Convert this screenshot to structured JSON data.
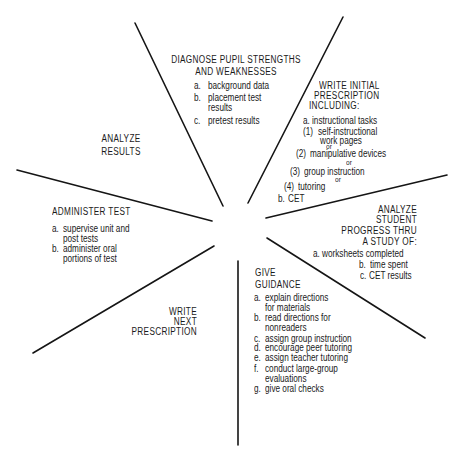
{
  "diagram": {
    "type": "cycle-wheel",
    "sectors": {
      "diagnose": {
        "title": [
          "DIAGNOSE PUPIL STRENGTHS",
          "AND WEAKNESSES"
        ],
        "items": [
          {
            "marker": "a.",
            "lines": [
              "background data"
            ]
          },
          {
            "marker": "b.",
            "lines": [
              "placement test",
              "results"
            ]
          },
          {
            "marker": "c.",
            "lines": [
              "pretest results"
            ]
          }
        ]
      },
      "write_initial": {
        "title": [
          "WRITE INITIAL",
          "PRESCRIPTION",
          "INCLUDING:"
        ],
        "items": [
          {
            "marker": "a.",
            "lines": [
              "instructional tasks"
            ]
          },
          {
            "marker": "(1)",
            "lines": [
              "self-instructional",
              "work pages"
            ]
          },
          {
            "connector": "or"
          },
          {
            "marker": "(2)",
            "lines": [
              "manipulative devices"
            ]
          },
          {
            "connector": "or"
          },
          {
            "marker": "(3)",
            "lines": [
              "group instruction"
            ]
          },
          {
            "connector": "or"
          },
          {
            "marker": "(4)",
            "lines": [
              "tutoring"
            ]
          },
          {
            "marker": "b.",
            "lines": [
              "CET"
            ]
          }
        ]
      },
      "analyze_progress": {
        "title": [
          "ANALYZE",
          "STUDENT",
          "PROGRESS THRU",
          "A STUDY OF:"
        ],
        "items": [
          {
            "marker": "a.",
            "lines": [
              "worksheets completed"
            ]
          },
          {
            "marker": "b.",
            "lines": [
              "time spent"
            ]
          },
          {
            "marker": "c.",
            "lines": [
              "CET results"
            ]
          }
        ]
      },
      "give_guidance": {
        "title": [
          "GIVE",
          "GUIDANCE"
        ],
        "items": [
          {
            "marker": "a.",
            "lines": [
              "explain directions",
              "for materials"
            ]
          },
          {
            "marker": "b.",
            "lines": [
              "read directions for",
              "nonreaders"
            ]
          },
          {
            "marker": "c.",
            "lines": [
              "assign group instruction"
            ]
          },
          {
            "marker": "d.",
            "lines": [
              "encourage peer tutoring"
            ]
          },
          {
            "marker": "e.",
            "lines": [
              "assign teacher tutoring"
            ]
          },
          {
            "marker": "f.",
            "lines": [
              "conduct large-group",
              "evaluations"
            ]
          },
          {
            "marker": "g.",
            "lines": [
              "give oral checks"
            ]
          }
        ]
      },
      "write_next": {
        "title": [
          "WRITE",
          "NEXT",
          "PRESCRIPTION"
        ]
      },
      "administer_test": {
        "title": [
          "ADMINISTER TEST"
        ],
        "items": [
          {
            "marker": "a.",
            "lines": [
              "supervise unit and",
              "post tests"
            ]
          },
          {
            "marker": "b.",
            "lines": [
              "administer oral",
              "portions of test"
            ]
          }
        ]
      },
      "analyze_results": {
        "title": [
          "ANALYZE",
          "RESULTS"
        ]
      }
    },
    "colors": {
      "ink": "#1a1a1a",
      "background": "#ffffff"
    }
  }
}
